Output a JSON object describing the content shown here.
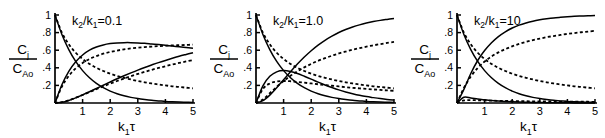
{
  "figure": {
    "type": "multi-panel-line-chart",
    "panel_count": 3,
    "background": "#ffffff",
    "line_color": "#000000"
  },
  "chart_data": [
    {
      "type": "line",
      "title": "k₂/k₁=0.1",
      "title_parts": {
        "k2": "k",
        "k2sub": "2",
        "slash": "/",
        "k1": "k",
        "k1sub": "1",
        "eq": "=0.1"
      },
      "xlabel": "k₁τ",
      "xlabel_parts": {
        "k": "k",
        "sub": "1",
        "tau": "τ"
      },
      "ylabel": "C_j / C_Ao",
      "ylabel_parts": {
        "num": "C",
        "num_sub": "j",
        "den": "C",
        "den_sub": "Ao"
      },
      "xlim": [
        0,
        5
      ],
      "ylim": [
        0,
        1
      ],
      "xticks": [
        1,
        2,
        3,
        4,
        5
      ],
      "xticklabels": [
        "1",
        "2",
        "3",
        "4",
        "5"
      ],
      "yticks": [
        0.2,
        0.4,
        0.6,
        0.8,
        1
      ],
      "yticklabels": [
        ".2",
        ".4",
        ".6",
        ".8",
        "1"
      ],
      "grid": false,
      "legend": "none",
      "x": [
        0,
        0.25,
        0.5,
        0.75,
        1,
        1.25,
        1.5,
        1.75,
        2,
        2.25,
        2.5,
        2.75,
        3,
        3.25,
        3.5,
        3.75,
        4,
        4.25,
        4.5,
        4.75,
        5
      ],
      "series": [
        {
          "name": "A-solid-decay",
          "style": "solid",
          "values": [
            1.0,
            0.779,
            0.607,
            0.472,
            0.368,
            0.287,
            0.223,
            0.174,
            0.135,
            0.105,
            0.082,
            0.064,
            0.05,
            0.039,
            0.03,
            0.024,
            0.018,
            0.014,
            0.011,
            0.009,
            0.007
          ]
        },
        {
          "name": "A-dashed-decay",
          "style": "dashed",
          "values": [
            1.0,
            0.8,
            0.667,
            0.571,
            0.5,
            0.444,
            0.4,
            0.364,
            0.333,
            0.308,
            0.286,
            0.267,
            0.25,
            0.235,
            0.222,
            0.211,
            0.2,
            0.19,
            0.182,
            0.174,
            0.167
          ]
        },
        {
          "name": "R-solid-max",
          "style": "solid",
          "values": [
            0.0,
            0.207,
            0.359,
            0.468,
            0.546,
            0.6,
            0.636,
            0.66,
            0.675,
            0.683,
            0.686,
            0.686,
            0.683,
            0.678,
            0.671,
            0.664,
            0.656,
            0.647,
            0.639,
            0.63,
            0.621
          ]
        },
        {
          "name": "R-dashed-plateau",
          "style": "dashed",
          "values": [
            0.0,
            0.186,
            0.308,
            0.393,
            0.455,
            0.5,
            0.533,
            0.56,
            0.58,
            0.596,
            0.61,
            0.62,
            0.628,
            0.635,
            0.641,
            0.646,
            0.65,
            0.654,
            0.657,
            0.66,
            0.663
          ]
        },
        {
          "name": "S-solid-rise",
          "style": "solid",
          "values": [
            0.0,
            0.008,
            0.029,
            0.058,
            0.092,
            0.128,
            0.165,
            0.202,
            0.239,
            0.275,
            0.309,
            0.342,
            0.374,
            0.404,
            0.432,
            0.459,
            0.484,
            0.508,
            0.531,
            0.552,
            0.572
          ]
        },
        {
          "name": "S-dashed-rise",
          "style": "dashed",
          "values": [
            0.0,
            0.01,
            0.031,
            0.06,
            0.091,
            0.124,
            0.157,
            0.189,
            0.22,
            0.25,
            0.278,
            0.305,
            0.33,
            0.354,
            0.377,
            0.398,
            0.418,
            0.437,
            0.455,
            0.472,
            0.488
          ]
        }
      ],
      "endpoint_values_at_x5": [
        0.007,
        0.167,
        0.621,
        0.663,
        0.572,
        0.488
      ]
    },
    {
      "type": "line",
      "title": "k₂/k₁=1.0",
      "title_parts": {
        "k2": "k",
        "k2sub": "2",
        "slash": "/",
        "k1": "k",
        "k1sub": "1",
        "eq": "=1.0"
      },
      "xlabel": "k₁τ",
      "xlabel_parts": {
        "k": "k",
        "sub": "1",
        "tau": "τ"
      },
      "ylabel": "C_j / C_Ao",
      "ylabel_parts": {
        "num": "C",
        "num_sub": "j",
        "den": "C",
        "den_sub": "Ao"
      },
      "xlim": [
        0,
        5
      ],
      "ylim": [
        0,
        1
      ],
      "xticks": [
        1,
        2,
        3,
        4,
        5
      ],
      "xticklabels": [
        "1",
        "2",
        "3",
        "4",
        "5"
      ],
      "yticks": [
        0.2,
        0.4,
        0.6,
        0.8,
        1
      ],
      "yticklabels": [
        ".2",
        ".4",
        ".6",
        ".8",
        "1"
      ],
      "grid": false,
      "legend": "none",
      "x": [
        0,
        0.25,
        0.5,
        0.75,
        1,
        1.25,
        1.5,
        1.75,
        2,
        2.25,
        2.5,
        2.75,
        3,
        3.25,
        3.5,
        3.75,
        4,
        4.25,
        4.5,
        4.75,
        5
      ],
      "series": [
        {
          "name": "A-solid-decay",
          "style": "solid",
          "values": [
            1.0,
            0.779,
            0.607,
            0.472,
            0.368,
            0.287,
            0.223,
            0.174,
            0.135,
            0.105,
            0.082,
            0.064,
            0.05,
            0.039,
            0.03,
            0.024,
            0.018,
            0.014,
            0.011,
            0.009,
            0.007
          ]
        },
        {
          "name": "A-dashed-decay",
          "style": "dashed",
          "values": [
            1.0,
            0.8,
            0.667,
            0.571,
            0.5,
            0.444,
            0.4,
            0.364,
            0.333,
            0.308,
            0.286,
            0.267,
            0.25,
            0.235,
            0.222,
            0.211,
            0.2,
            0.19,
            0.182,
            0.174,
            0.167
          ]
        },
        {
          "name": "R-solid-peak",
          "style": "solid",
          "values": [
            0.0,
            0.195,
            0.303,
            0.354,
            0.368,
            0.358,
            0.335,
            0.304,
            0.271,
            0.237,
            0.205,
            0.176,
            0.149,
            0.126,
            0.106,
            0.088,
            0.073,
            0.061,
            0.05,
            0.041,
            0.034
          ]
        },
        {
          "name": "R-dashed-peak",
          "style": "dashed",
          "values": [
            0.0,
            0.16,
            0.222,
            0.245,
            0.25,
            0.247,
            0.24,
            0.231,
            0.222,
            0.213,
            0.204,
            0.196,
            0.188,
            0.18,
            0.173,
            0.166,
            0.16,
            0.154,
            0.149,
            0.143,
            0.139
          ]
        },
        {
          "name": "S-solid-rise",
          "style": "solid",
          "values": [
            0.0,
            0.026,
            0.09,
            0.174,
            0.264,
            0.355,
            0.442,
            0.522,
            0.594,
            0.658,
            0.713,
            0.76,
            0.801,
            0.835,
            0.864,
            0.888,
            0.908,
            0.925,
            0.939,
            0.95,
            0.96
          ]
        },
        {
          "name": "S-dashed-rise",
          "style": "dashed",
          "values": [
            0.0,
            0.04,
            0.111,
            0.184,
            0.25,
            0.309,
            0.36,
            0.405,
            0.444,
            0.479,
            0.51,
            0.537,
            0.563,
            0.585,
            0.605,
            0.623,
            0.64,
            0.655,
            0.669,
            0.682,
            0.694
          ]
        }
      ],
      "endpoint_values_at_x5": [
        0.007,
        0.167,
        0.034,
        0.139,
        0.96,
        0.694
      ]
    },
    {
      "type": "line",
      "title": "k₂/k₁=10",
      "title_parts": {
        "k2": "k",
        "k2sub": "2",
        "slash": "/",
        "k1": "k",
        "k1sub": "1",
        "eq": "=10"
      },
      "xlabel": "k₁τ",
      "xlabel_parts": {
        "k": "k",
        "sub": "1",
        "tau": "τ"
      },
      "ylabel": "C_j / C_Ao",
      "ylabel_parts": {
        "num": "C",
        "num_sub": "j",
        "den": "C",
        "den_sub": "Ao"
      },
      "xlim": [
        0,
        5
      ],
      "ylim": [
        0,
        1
      ],
      "xticks": [
        1,
        2,
        3,
        4,
        5
      ],
      "xticklabels": [
        "1",
        "2",
        "3",
        "4",
        "5"
      ],
      "yticks": [
        0.2,
        0.4,
        0.6,
        0.8,
        1
      ],
      "yticklabels": [
        ".2",
        ".4",
        ".6",
        ".8",
        "1"
      ],
      "grid": false,
      "legend": "none",
      "x": [
        0,
        0.25,
        0.5,
        0.75,
        1,
        1.25,
        1.5,
        1.75,
        2,
        2.25,
        2.5,
        2.75,
        3,
        3.25,
        3.5,
        3.75,
        4,
        4.25,
        4.5,
        4.75,
        5
      ],
      "series": [
        {
          "name": "A-solid-decay",
          "style": "solid",
          "values": [
            1.0,
            0.779,
            0.607,
            0.472,
            0.368,
            0.287,
            0.223,
            0.174,
            0.135,
            0.105,
            0.082,
            0.064,
            0.05,
            0.039,
            0.03,
            0.024,
            0.018,
            0.014,
            0.011,
            0.009,
            0.007
          ]
        },
        {
          "name": "A-dashed-decay",
          "style": "dashed",
          "values": [
            1.0,
            0.8,
            0.667,
            0.571,
            0.5,
            0.444,
            0.4,
            0.364,
            0.333,
            0.308,
            0.286,
            0.267,
            0.25,
            0.235,
            0.222,
            0.211,
            0.2,
            0.19,
            0.182,
            0.174,
            0.167
          ]
        },
        {
          "name": "R-solid-small",
          "style": "solid",
          "values": [
            0.0,
            0.066,
            0.058,
            0.045,
            0.036,
            0.028,
            0.022,
            0.017,
            0.013,
            0.01,
            0.008,
            0.006,
            0.005,
            0.004,
            0.003,
            0.002,
            0.002,
            0.001,
            0.001,
            0.001,
            0.0
          ]
        },
        {
          "name": "R-dashed-small",
          "style": "dashed",
          "values": [
            0.0,
            0.029,
            0.032,
            0.031,
            0.029,
            0.027,
            0.025,
            0.024,
            0.022,
            0.021,
            0.02,
            0.019,
            0.018,
            0.017,
            0.017,
            0.016,
            0.015,
            0.015,
            0.014,
            0.014,
            0.013
          ]
        },
        {
          "name": "S-solid-rise",
          "style": "solid",
          "values": [
            0.0,
            0.155,
            0.335,
            0.483,
            0.596,
            0.685,
            0.755,
            0.809,
            0.852,
            0.885,
            0.91,
            0.93,
            0.945,
            0.957,
            0.967,
            0.974,
            0.98,
            0.985,
            0.988,
            0.991,
            0.993
          ]
        },
        {
          "name": "S-dashed-rise",
          "style": "dashed",
          "values": [
            0.0,
            0.171,
            0.301,
            0.398,
            0.471,
            0.529,
            0.575,
            0.612,
            0.644,
            0.671,
            0.694,
            0.714,
            0.732,
            0.748,
            0.761,
            0.773,
            0.785,
            0.795,
            0.804,
            0.812,
            0.82
          ]
        }
      ],
      "endpoint_values_at_x5": [
        0.007,
        0.167,
        0.0,
        0.013,
        0.993,
        0.82
      ]
    }
  ]
}
